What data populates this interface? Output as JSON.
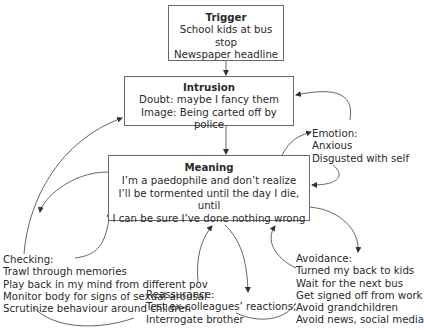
{
  "diagram": {
    "trigger": {
      "title": "Trigger",
      "lines": [
        "School kids at bus stop",
        "Newspaper headline"
      ]
    },
    "intrusion": {
      "title": "Intrusion",
      "lines": [
        "Doubt: maybe I fancy them",
        "Image: Being carted off by police"
      ]
    },
    "meaning": {
      "title": "Meaning",
      "lines": [
        "I’m a paedophile and don’t realize",
        "I’ll be tormented until the day I die, until",
        "I can be sure I’ve done nothing wrong"
      ]
    },
    "emotion": {
      "title": "Emotion:",
      "lines": [
        "Anxious",
        "Disgusted with self"
      ]
    },
    "checking": {
      "title": "Checking:",
      "lines": [
        "Trawl through memories",
        "Play back in my mind from different pov",
        "Monitor body for signs of sexual arousal",
        "Scrutinize behaviour around children"
      ]
    },
    "reassurance": {
      "title": "Reassurance:",
      "lines": [
        "Test ex-colleagues’ reactions;",
        "Interrogate brother"
      ]
    },
    "avoidance": {
      "title": "Avoidance:",
      "lines": [
        "Turned my back to kids",
        "Wait for the next bus",
        "Get signed off from work",
        "Avoid grandchildren",
        "Avoid news, social media"
      ]
    },
    "connections": [
      {
        "from": "trigger",
        "to": "intrusion"
      },
      {
        "from": "intrusion",
        "to": "meaning"
      },
      {
        "from": "meaning",
        "to": "emotion"
      },
      {
        "from": "emotion",
        "to": "intrusion"
      },
      {
        "from": "emotion",
        "to": "meaning"
      },
      {
        "from": "meaning",
        "to": "checking"
      },
      {
        "from": "checking",
        "to": "intrusion"
      },
      {
        "from": "checking",
        "to": "meaning"
      },
      {
        "from": "meaning",
        "to": "reassurance"
      },
      {
        "from": "reassurance",
        "to": "meaning"
      },
      {
        "from": "meaning",
        "to": "avoidance"
      },
      {
        "from": "avoidance",
        "to": "meaning"
      }
    ]
  }
}
